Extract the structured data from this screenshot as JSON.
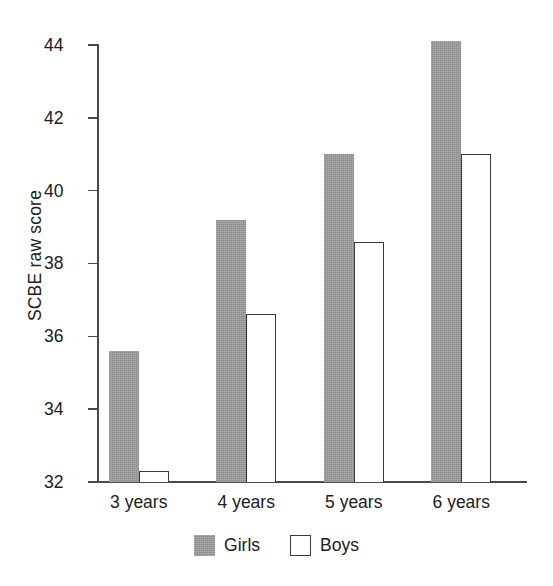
{
  "chart_data": {
    "type": "bar",
    "title": "",
    "xlabel": "",
    "ylabel": "SCBE raw score",
    "categories": [
      "3 years",
      "4 years",
      "5 years",
      "6 years"
    ],
    "series": [
      {
        "name": "Girls",
        "color": "#8a8a8a",
        "values": [
          35.6,
          39.2,
          41.0,
          44.1
        ]
      },
      {
        "name": "Boys",
        "color": "#ffffff",
        "values": [
          32.3,
          36.6,
          38.6,
          41.0
        ]
      }
    ],
    "ylim": [
      32,
      44
    ],
    "yticks": [
      "32",
      "34",
      "36",
      "38",
      "40",
      "42",
      "44"
    ],
    "ytick_values": [
      32,
      34,
      36,
      38,
      40,
      42,
      44
    ],
    "grid": false,
    "legend_position": "bottom-center",
    "legend_entries": [
      "Girls",
      "Boys"
    ]
  }
}
